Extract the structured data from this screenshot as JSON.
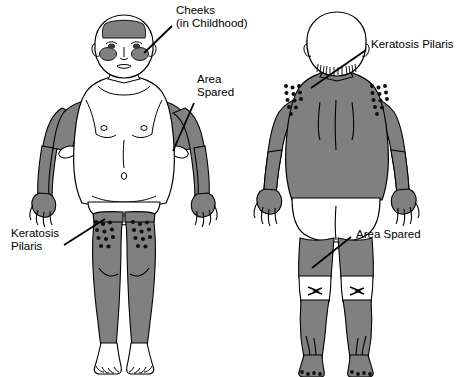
{
  "figure": {
    "background_color": "#ffffff",
    "ink_color": "#000000",
    "affected_shade_color": "#808080",
    "spared_color": "#ffffff",
    "papule_color": "#101010"
  },
  "labels": {
    "cheeks_line1": "Cheeks",
    "cheeks_line2": "(in Childhood)",
    "keratosis_pilaris_right": "Keratosis Pilaris",
    "area_spared_top_line1": "Area",
    "area_spared_top_line2": "Spared",
    "keratosis_pilaris_left_line1": "Keratosis",
    "keratosis_pilaris_left_line2": "Pilaris",
    "area_spared_bottom": "Area Spared"
  },
  "views": {
    "anterior": {
      "name": "anterior-view",
      "affected_regions": [
        "forehead hairband",
        "cheeks",
        "upper arms",
        "forearms",
        "hands",
        "thighs",
        "lower legs"
      ],
      "spared_regions": [
        "trunk",
        "antecubital fossae",
        "groin",
        "feet"
      ],
      "papule_regions": [
        "outer thighs"
      ]
    },
    "posterior": {
      "name": "posterior-view",
      "affected_regions": [
        "neck",
        "upper back",
        "shoulders",
        "arms",
        "hands",
        "posterior thighs",
        "calves",
        "feet"
      ],
      "spared_regions": [
        "scalp",
        "buttocks",
        "popliteal fossae"
      ],
      "papule_regions": [
        "deltoids",
        "outer arms",
        "heels"
      ]
    }
  }
}
